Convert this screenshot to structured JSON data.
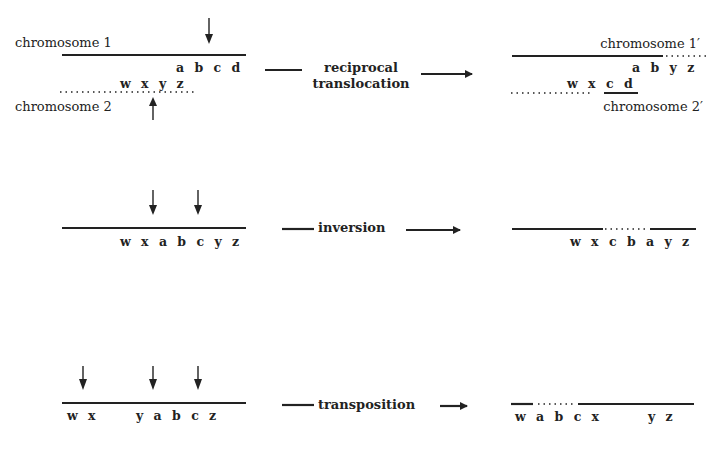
{
  "diagram": {
    "rows": [
      {
        "name": "reciprocal-translocation",
        "operation_label_line1": "reciprocal",
        "operation_label_line2": "translocation",
        "before": {
          "chromosome1_label": "chromosome 1",
          "chromosome1_genes": "a b c d",
          "chromosome2_label": "chromosome 2",
          "chromosome2_genes": "w x y z",
          "break_arrows": 2
        },
        "after": {
          "chromosome1_label": "chromosome 1′",
          "chromosome1_genes": "a b y z",
          "chromosome2_label": "chromosome 2′",
          "chromosome2_genes": "w x c d"
        }
      },
      {
        "name": "inversion",
        "operation_label": "inversion",
        "before": {
          "genes": "w x a b c y z",
          "break_arrows": 2
        },
        "after": {
          "genes": "w x c b a y z"
        }
      },
      {
        "name": "transposition",
        "operation_label": "transposition",
        "before": {
          "genes_left": "w x",
          "genes_right": "y a b c z",
          "break_arrows": 3
        },
        "after": {
          "genes_left": "w a b c x",
          "genes_right": "y z"
        }
      }
    ]
  }
}
